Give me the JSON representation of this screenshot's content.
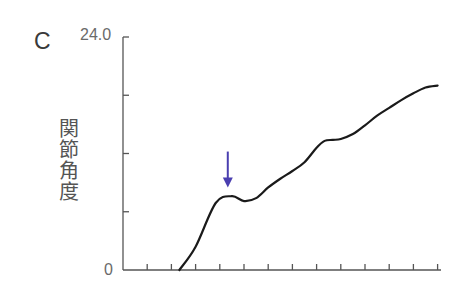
{
  "chart_data": {
    "type": "line",
    "panel_label": "C",
    "title": "",
    "xlabel": "",
    "ylabel": "関節角度",
    "ylim": [
      0,
      24.0
    ],
    "y_tick_labels": [
      "0",
      "24.0"
    ],
    "y_ticks": [
      0,
      6,
      12,
      18,
      24
    ],
    "x_tick_count": 13,
    "grid": false,
    "legend": null,
    "series": [
      {
        "name": "関節角度",
        "color": "#1a1a1a",
        "x": [
          2.33,
          3.0,
          3.83,
          4.5,
          5.0,
          5.5,
          6.0,
          6.5,
          7.0,
          7.5,
          8.0,
          8.33,
          8.67,
          9.0,
          9.5,
          10.0,
          10.5,
          11.0,
          11.5,
          12.0,
          12.5,
          13.0
        ],
        "values": [
          0,
          2.4,
          6.9,
          7.6,
          7.1,
          7.4,
          8.5,
          9.4,
          10.2,
          11.1,
          12.6,
          13.3,
          13.4,
          13.5,
          14.0,
          14.9,
          15.9,
          16.7,
          17.5,
          18.2,
          18.8,
          19.0
        ]
      }
    ],
    "annotations": [
      {
        "type": "arrow",
        "direction": "down",
        "x": 4.33,
        "y_from": 12.2,
        "y_to": 8.5,
        "color": "#4a3fb0",
        "meaning": "points to first local peak"
      }
    ]
  }
}
